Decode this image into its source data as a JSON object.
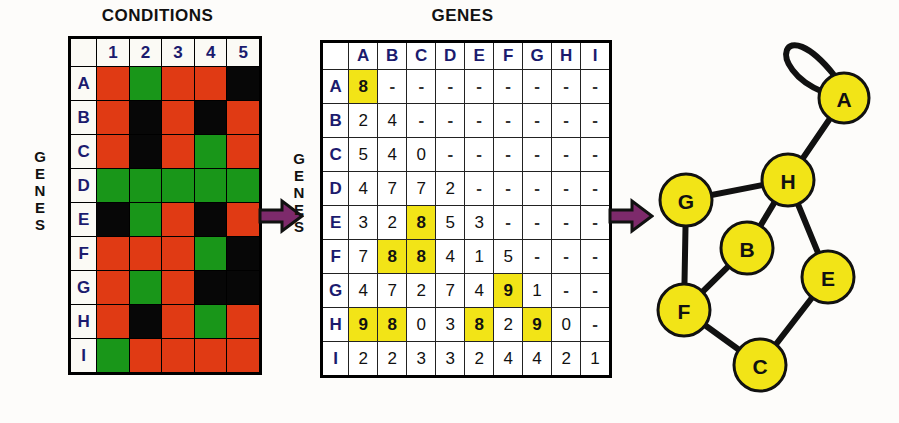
{
  "panels": {
    "heatmap": {
      "title": "CONDITIONS",
      "side_label": "GENES",
      "col_headers": [
        "1",
        "2",
        "3",
        "4",
        "5"
      ],
      "row_headers": [
        "A",
        "B",
        "C",
        "D",
        "E",
        "F",
        "G",
        "H",
        "I"
      ],
      "cells": [
        [
          "red",
          "green",
          "red",
          "red",
          "black"
        ],
        [
          "red",
          "black",
          "red",
          "black",
          "red"
        ],
        [
          "red",
          "black",
          "red",
          "green",
          "red"
        ],
        [
          "green",
          "green",
          "green",
          "green",
          "green"
        ],
        [
          "black",
          "green",
          "red",
          "black",
          "red"
        ],
        [
          "red",
          "red",
          "red",
          "green",
          "black"
        ],
        [
          "red",
          "green",
          "red",
          "black",
          "black"
        ],
        [
          "red",
          "black",
          "red",
          "green",
          "red"
        ],
        [
          "green",
          "red",
          "red",
          "red",
          "red"
        ]
      ],
      "legend_colors": {
        "red": "#e03a14",
        "green": "#199619",
        "black": "#070707"
      }
    },
    "matrix": {
      "title": "GENES",
      "side_label": "GENES",
      "col_headers": [
        "A",
        "B",
        "C",
        "D",
        "E",
        "F",
        "G",
        "H",
        "I"
      ],
      "row_headers": [
        "A",
        "B",
        "C",
        "D",
        "E",
        "F",
        "G",
        "H",
        "I"
      ],
      "highlight_color": "#f2e417",
      "rows": [
        {
          "label": "A",
          "values": [
            "8",
            "-",
            "-",
            "-",
            "-",
            "-",
            "-",
            "-",
            "-"
          ],
          "highlight": [
            true,
            false,
            false,
            false,
            false,
            false,
            false,
            false,
            false
          ]
        },
        {
          "label": "B",
          "values": [
            "2",
            "4",
            "-",
            "-",
            "-",
            "-",
            "-",
            "-",
            "-"
          ],
          "highlight": [
            false,
            false,
            false,
            false,
            false,
            false,
            false,
            false,
            false
          ]
        },
        {
          "label": "C",
          "values": [
            "5",
            "4",
            "0",
            "-",
            "-",
            "-",
            "-",
            "-",
            "-"
          ],
          "highlight": [
            false,
            false,
            false,
            false,
            false,
            false,
            false,
            false,
            false
          ]
        },
        {
          "label": "D",
          "values": [
            "4",
            "7",
            "7",
            "2",
            "-",
            "-",
            "-",
            "-",
            "-"
          ],
          "highlight": [
            false,
            false,
            false,
            false,
            false,
            false,
            false,
            false,
            false
          ]
        },
        {
          "label": "E",
          "values": [
            "3",
            "2",
            "8",
            "5",
            "3",
            "-",
            "-",
            "-",
            "-"
          ],
          "highlight": [
            false,
            false,
            true,
            false,
            false,
            false,
            false,
            false,
            false
          ]
        },
        {
          "label": "F",
          "values": [
            "7",
            "8",
            "8",
            "4",
            "1",
            "5",
            "-",
            "-",
            "-"
          ],
          "highlight": [
            false,
            true,
            true,
            false,
            false,
            false,
            false,
            false,
            false
          ]
        },
        {
          "label": "G",
          "values": [
            "4",
            "7",
            "2",
            "7",
            "4",
            "9",
            "1",
            "-",
            "-"
          ],
          "highlight": [
            false,
            false,
            false,
            false,
            false,
            true,
            false,
            false,
            false
          ]
        },
        {
          "label": "H",
          "values": [
            "9",
            "8",
            "0",
            "3",
            "8",
            "2",
            "9",
            "0",
            "-"
          ],
          "highlight": [
            true,
            true,
            false,
            false,
            true,
            false,
            true,
            false,
            false
          ]
        },
        {
          "label": "I",
          "values": [
            "2",
            "2",
            "3",
            "3",
            "2",
            "4",
            "4",
            "2",
            "1"
          ],
          "highlight": [
            false,
            false,
            false,
            false,
            false,
            false,
            false,
            false,
            false
          ]
        }
      ]
    },
    "graph": {
      "node_fill": "#f2e417",
      "node_stroke": "#111111",
      "nodes": [
        {
          "id": "A",
          "label": "A",
          "cx": 232,
          "cy": 98,
          "r": 25
        },
        {
          "id": "H",
          "label": "H",
          "cx": 176,
          "cy": 180,
          "r": 26
        },
        {
          "id": "G",
          "label": "G",
          "cx": 74,
          "cy": 200,
          "r": 26
        },
        {
          "id": "B",
          "label": "B",
          "cx": 135,
          "cy": 248,
          "r": 26
        },
        {
          "id": "E",
          "label": "E",
          "cx": 216,
          "cy": 277,
          "r": 26
        },
        {
          "id": "F",
          "label": "F",
          "cx": 72,
          "cy": 310,
          "r": 26
        },
        {
          "id": "C",
          "label": "C",
          "cx": 148,
          "cy": 365,
          "r": 26
        }
      ],
      "edges": [
        {
          "from": "A",
          "to": "A",
          "type": "self-loop"
        },
        {
          "from": "A",
          "to": "H",
          "type": "line"
        },
        {
          "from": "H",
          "to": "G",
          "type": "line"
        },
        {
          "from": "H",
          "to": "B",
          "type": "line"
        },
        {
          "from": "H",
          "to": "E",
          "type": "line"
        },
        {
          "from": "G",
          "to": "F",
          "type": "line"
        },
        {
          "from": "B",
          "to": "F",
          "type": "line"
        },
        {
          "from": "F",
          "to": "C",
          "type": "line"
        },
        {
          "from": "C",
          "to": "E",
          "type": "line"
        }
      ]
    }
  },
  "arrows": {
    "color": "#7d2a6b",
    "outline": "#111111",
    "items": [
      {
        "name": "arrow-heatmap-to-matrix",
        "x": 258,
        "y": 198
      },
      {
        "name": "arrow-matrix-to-graph",
        "x": 608,
        "y": 198
      }
    ]
  }
}
